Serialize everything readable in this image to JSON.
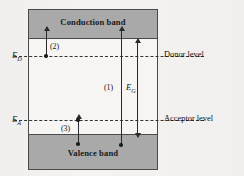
{
  "figure": {
    "bands": {
      "conduction_label": "Conduction band",
      "valence_label": "Valence band"
    },
    "levels": [
      {
        "key": "donor",
        "symbol": "E",
        "subscript": "D",
        "right_label": "Donor level",
        "y": 56
      },
      {
        "key": "acceptor",
        "symbol": "E",
        "subscript": "A",
        "right_label": "Acceptor level",
        "y": 120
      }
    ],
    "transitions": [
      {
        "id": "2",
        "label": "(2)",
        "description": "donor level to conduction band"
      },
      {
        "id": "1",
        "label": "(1)",
        "description": "valence band to conduction band"
      },
      {
        "id": "3",
        "label": "(3)",
        "description": "valence band to acceptor level"
      }
    ],
    "gap": {
      "symbol": "E",
      "subscript": "G",
      "label": "EG",
      "description": "band gap energy"
    },
    "colors": {
      "band_fill": "#a9a9a9",
      "frame_stroke": "#4a4a4a",
      "arrow_stroke": "#2a2a2a",
      "background": "#f4f3f1",
      "text": "#141414"
    }
  }
}
